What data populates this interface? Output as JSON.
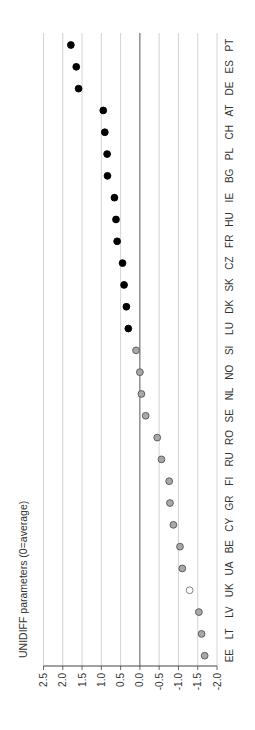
{
  "chart_data": {
    "type": "scatter",
    "orientation": "rotated-90-clockwise",
    "title": "",
    "ylabel": "UNIDIFF parameters (0=average)",
    "xlabel": "",
    "ylim": [
      -2.0,
      2.5
    ],
    "yticks": [
      "2.5",
      "2.0",
      "1.5",
      "1.0",
      "0.5",
      "0.0",
      "-0.5",
      "-1.0",
      "-1.5",
      "-2.0"
    ],
    "ytick_values": [
      2.5,
      2.0,
      1.5,
      1.0,
      0.5,
      0.0,
      -0.5,
      -1.0,
      -1.5,
      -2.0
    ],
    "grid": true,
    "reference_line": 0.0,
    "categories": [
      "EE",
      "LT",
      "LV",
      "UK",
      "UA",
      "BE",
      "CY",
      "GR",
      "FI",
      "RU",
      "RO",
      "SE",
      "NL",
      "NO",
      "SI",
      "LU",
      "DK",
      "SK",
      "CZ",
      "FR",
      "HU",
      "IE",
      "BG",
      "PL",
      "CH",
      "AT",
      "DE",
      "ES",
      "PT"
    ],
    "values": [
      -1.68,
      -1.6,
      -1.53,
      -1.29,
      -1.1,
      -1.04,
      -0.87,
      -0.78,
      -0.76,
      -0.56,
      -0.45,
      -0.15,
      -0.04,
      0.0,
      0.1,
      0.3,
      0.35,
      0.41,
      0.45,
      0.59,
      0.62,
      0.66,
      0.84,
      0.85,
      0.91,
      0.95,
      1.59,
      1.65,
      1.79
    ],
    "marker_style": [
      "gray",
      "gray",
      "gray",
      "hollow",
      "gray",
      "gray",
      "gray",
      "gray",
      "gray",
      "gray",
      "gray",
      "gray",
      "gray",
      "gray",
      "gray",
      "black",
      "black",
      "black",
      "black",
      "black",
      "black",
      "black",
      "black",
      "black",
      "black",
      "black",
      "black",
      "black",
      "black"
    ],
    "marker_colors": {
      "black": {
        "fill": "#000000",
        "stroke": "#000000"
      },
      "gray": {
        "fill": "#a8a8a8",
        "stroke": "#555555"
      },
      "hollow": {
        "fill": "#ffffff",
        "stroke": "#777777"
      }
    },
    "grid_color": "#c8c8c8",
    "axis_color": "#444444"
  }
}
